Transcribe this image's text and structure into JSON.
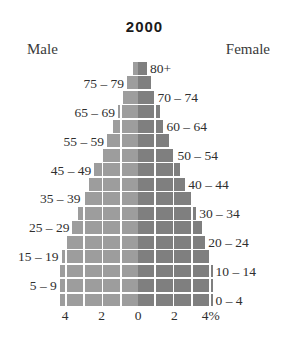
{
  "chart_data": {
    "type": "bar",
    "title": "2000",
    "subtitle": "",
    "xlabel": "",
    "ylabel": "",
    "orientation": "population-pyramid",
    "grid": true,
    "legend_position": "top",
    "xlim": [
      -5,
      5
    ],
    "xticks": [
      "4",
      "2",
      "0",
      "2",
      "4%"
    ],
    "xtick_values": [
      -4,
      -2,
      0,
      2,
      4
    ],
    "axis_unit": "%",
    "categories": [
      "0 – 4",
      "5 – 9",
      "10 – 14",
      "15 – 19",
      "20 – 24",
      "25 – 29",
      "30 – 34",
      "35 – 39",
      "40 – 44",
      "45 – 49",
      "50 – 54",
      "55 – 59",
      "60 – 64",
      "65 – 69",
      "70 – 74",
      "75 – 79",
      "80+"
    ],
    "series": [
      {
        "name": "Male",
        "side": "left",
        "color": "#9d9d9d",
        "values": [
          4.3,
          4.3,
          4.3,
          4.2,
          3.9,
          3.6,
          3.3,
          3.0,
          2.7,
          2.4,
          2.0,
          1.7,
          1.4,
          1.1,
          0.8,
          0.6,
          0.3
        ]
      },
      {
        "name": "Female",
        "side": "right",
        "color": "#7f7f7f",
        "values": [
          4.1,
          4.1,
          4.1,
          4.0,
          3.7,
          3.5,
          3.2,
          2.9,
          2.6,
          2.3,
          2.0,
          1.7,
          1.4,
          1.2,
          0.9,
          0.7,
          0.5
        ]
      }
    ],
    "label_side": [
      "right",
      "left",
      "right",
      "left",
      "right",
      "left",
      "right",
      "left",
      "right",
      "left",
      "right",
      "left",
      "right",
      "left",
      "right",
      "left",
      "right"
    ]
  },
  "header": {
    "male_label": "Male",
    "female_label": "Female"
  }
}
